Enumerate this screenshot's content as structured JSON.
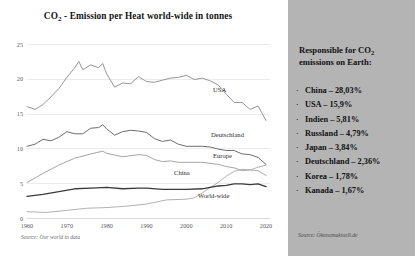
{
  "chart_data": {
    "type": "line",
    "title": "CO2 - Emission per Heat world-wide in tonnes",
    "title_main": "CO",
    "title_sub": "2",
    "title_rest": " - Emission per Heat world-wide in tonnes",
    "xlabel": "",
    "ylabel": "",
    "xlim": [
      1960,
      2021
    ],
    "ylim": [
      0,
      25
    ],
    "grid": true,
    "legend_position": "inline-right",
    "x_ticks": [
      "1960",
      "1970",
      "1980",
      "1990",
      "2000",
      "2010",
      "2020"
    ],
    "y_ticks": [
      "0",
      "5",
      "10",
      "15",
      "20",
      "25"
    ],
    "source": "Source: Our world in data",
    "series": [
      {
        "name": "USA",
        "color": "#8a8a8a",
        "label_x": 213,
        "label_y": 86,
        "x": [
          1960,
          1962,
          1964,
          1966,
          1968,
          1970,
          1972,
          1973,
          1974,
          1976,
          1978,
          1979,
          1980,
          1982,
          1984,
          1986,
          1988,
          1990,
          1992,
          1994,
          1996,
          1998,
          2000,
          2002,
          2004,
          2006,
          2008,
          2010,
          2012,
          2014,
          2016,
          2018,
          2020
        ],
        "values": [
          16.0,
          15.6,
          16.3,
          17.4,
          18.6,
          20.2,
          21.6,
          22.5,
          21.3,
          22.0,
          21.6,
          22.2,
          20.7,
          18.8,
          19.4,
          19.3,
          20.3,
          19.6,
          19.5,
          19.8,
          20.1,
          20.2,
          20.5,
          19.9,
          20.1,
          19.7,
          19.1,
          17.8,
          16.6,
          16.6,
          15.6,
          16.1,
          14.0
        ]
      },
      {
        "name": "Deutschland",
        "color": "#5c5c5c",
        "label_x": 211,
        "label_y": 131,
        "x": [
          1960,
          1962,
          1964,
          1966,
          1968,
          1970,
          1972,
          1974,
          1976,
          1978,
          1979,
          1980,
          1982,
          1984,
          1986,
          1988,
          1990,
          1992,
          1994,
          1996,
          1998,
          2000,
          2002,
          2004,
          2006,
          2008,
          2010,
          2012,
          2014,
          2016,
          2018,
          2020
        ],
        "values": [
          10.3,
          10.6,
          11.3,
          11.1,
          11.6,
          12.4,
          12.1,
          12.1,
          12.9,
          13.0,
          13.4,
          12.8,
          11.9,
          12.4,
          12.6,
          12.5,
          12.3,
          11.4,
          11.0,
          11.2,
          10.6,
          10.3,
          10.3,
          10.3,
          10.2,
          9.9,
          9.7,
          9.7,
          9.2,
          9.1,
          8.7,
          7.7
        ]
      },
      {
        "name": "Europe",
        "color": "#9b9b9b",
        "label_x": 213,
        "label_y": 152,
        "x": [
          1960,
          1964,
          1968,
          1972,
          1976,
          1979,
          1980,
          1984,
          1988,
          1990,
          1992,
          1994,
          1996,
          1998,
          2000,
          2004,
          2008,
          2010,
          2012,
          2014,
          2016,
          2018,
          2020
        ],
        "values": [
          5.1,
          6.4,
          7.6,
          8.6,
          9.2,
          9.6,
          9.3,
          8.8,
          9.1,
          9.0,
          8.4,
          8.1,
          8.2,
          8.0,
          8.0,
          8.0,
          7.7,
          7.4,
          7.2,
          6.8,
          6.9,
          6.8,
          6.1
        ]
      },
      {
        "name": "China",
        "color": "#a8a8a8",
        "label_x": 174,
        "label_y": 169,
        "x": [
          1960,
          1965,
          1970,
          1975,
          1980,
          1985,
          1990,
          1995,
          2000,
          2002,
          2004,
          2006,
          2008,
          2010,
          2012,
          2014,
          2016,
          2018,
          2020
        ],
        "values": [
          0.9,
          0.8,
          1.1,
          1.4,
          1.5,
          1.7,
          2.0,
          2.6,
          2.7,
          2.9,
          3.6,
          4.4,
          5.1,
          6.0,
          6.7,
          7.0,
          6.9,
          7.3,
          7.6
        ]
      },
      {
        "name": "World-wide",
        "color": "#3a3a3a",
        "label_x": 198,
        "label_y": 192,
        "x": [
          1960,
          1964,
          1968,
          1972,
          1976,
          1980,
          1984,
          1988,
          1990,
          1994,
          1998,
          2000,
          2004,
          2008,
          2010,
          2012,
          2014,
          2016,
          2018,
          2020
        ],
        "values": [
          3.1,
          3.4,
          3.8,
          4.2,
          4.3,
          4.4,
          4.2,
          4.3,
          4.3,
          4.1,
          4.1,
          4.1,
          4.2,
          4.6,
          4.7,
          4.9,
          4.9,
          4.8,
          4.9,
          4.5
        ]
      }
    ]
  },
  "info_panel": {
    "heading_line1_main": "Responsible for CO",
    "heading_line1_sub": "2",
    "heading_line2": "emissions on Earth:",
    "bullet": "·",
    "items": [
      "China – 28,03%",
      "USA – 15,9%",
      "Indien – 5,81%",
      "Russland – 4,79%",
      "Japan – 3,84%",
      "Deutschland – 2,36%",
      "Korea – 1,78%",
      "Kanada – 1,67%"
    ],
    "source": "Source: Ökonomaktuell.de"
  }
}
